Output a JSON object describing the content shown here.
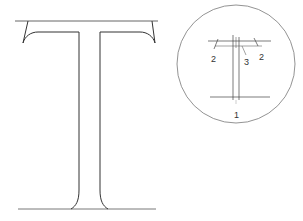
{
  "diagram": {
    "main_figure": {
      "description": "Large serif capital letter T outline with top and baseline guide lines",
      "stroke_color": "#333333",
      "guide_color": "#555555"
    },
    "inset_figure": {
      "description": "Circular inset showing construction lines of the T",
      "circle_color": "#777777",
      "labels": [
        {
          "id": "label-2-left",
          "text": "2"
        },
        {
          "id": "label-3",
          "text": "3"
        },
        {
          "id": "label-2-right",
          "text": "2"
        },
        {
          "id": "label-1",
          "text": "1"
        }
      ]
    }
  }
}
